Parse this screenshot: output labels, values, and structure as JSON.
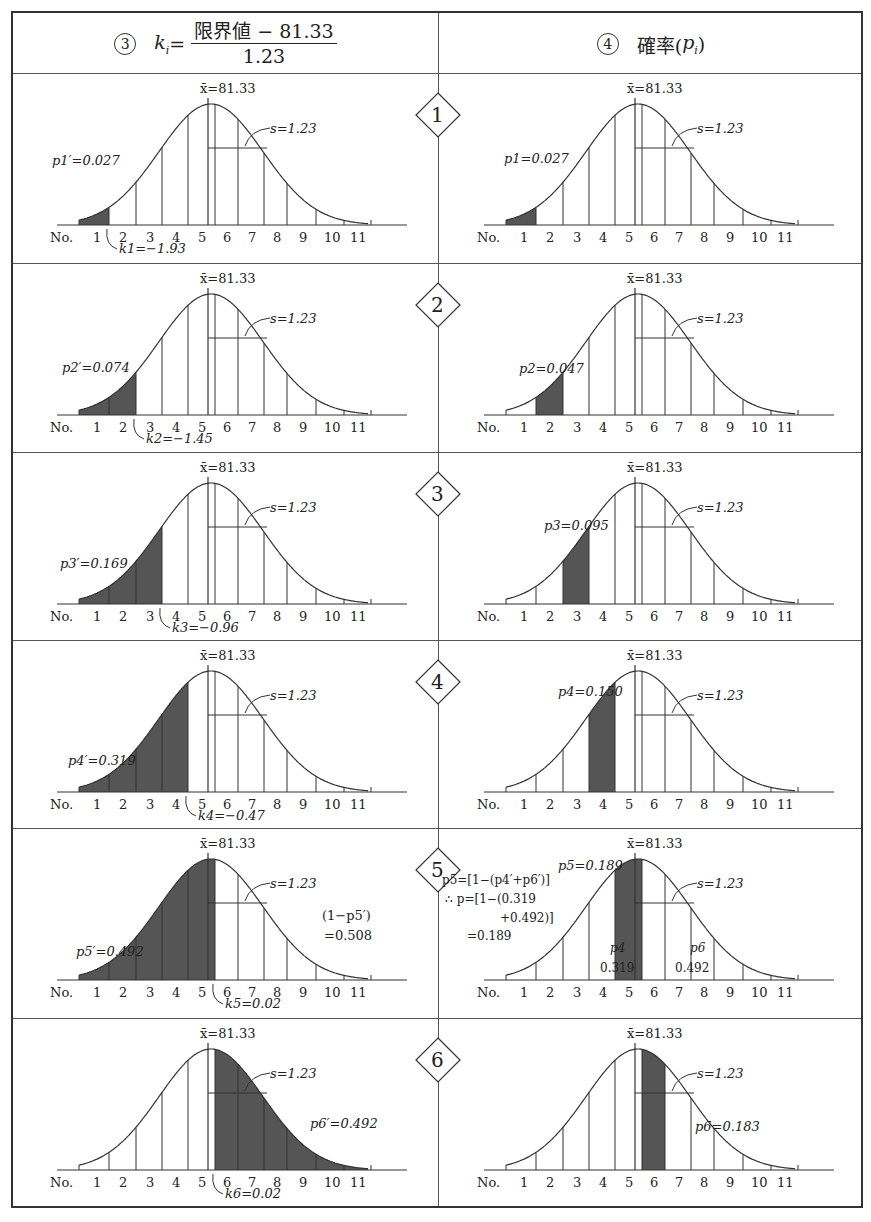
{
  "header": {
    "left": {
      "circle": "3",
      "lhs": "k",
      "lhs_sub": "i",
      "eq": "=",
      "numerator": "限界値 − 81.33",
      "denominator": "1.23"
    },
    "right": {
      "circle": "4",
      "label": "確率(",
      "p": "p",
      "p_sub": "i",
      "close": ")"
    }
  },
  "common": {
    "mean_label": "x̄=81.33",
    "sd_label": "s=1.23",
    "axis_prefix": "No.",
    "ticks": [
      "1",
      "2",
      "3",
      "4",
      "5",
      "6",
      "7",
      "8",
      "9",
      "10",
      "11"
    ]
  },
  "chart_data": [
    {
      "type": "area",
      "title": "Row 1 left",
      "step": "1",
      "k_label": "k1=−1.93",
      "k": -1.93,
      "shade": "cumulative-left",
      "area_label": "p1′=0.027",
      "area": 0.027
    },
    {
      "type": "area",
      "title": "Row 1 right",
      "step": "1",
      "shade_class": 1,
      "area_label": "p1=0.027",
      "area": 0.027
    },
    {
      "type": "area",
      "title": "Row 2 left",
      "step": "2",
      "k_label": "k2=−1.45",
      "k": -1.45,
      "shade": "cumulative-left",
      "area_label": "p2′=0.074",
      "area": 0.074
    },
    {
      "type": "area",
      "title": "Row 2 right",
      "step": "2",
      "shade_class": 2,
      "area_label": "p2=0.047",
      "area": 0.047
    },
    {
      "type": "area",
      "title": "Row 3 left",
      "step": "3",
      "k_label": "k3=−0.96",
      "k": -0.96,
      "shade": "cumulative-left",
      "area_label": "p3′=0.169",
      "area": 0.169
    },
    {
      "type": "area",
      "title": "Row 3 right",
      "step": "3",
      "shade_class": 3,
      "area_label": "p3=0.095",
      "area": 0.095
    },
    {
      "type": "area",
      "title": "Row 4 left",
      "step": "4",
      "k_label": "k4=−0.47",
      "k": -0.47,
      "shade": "cumulative-left",
      "area_label": "p4′=0.319",
      "area": 0.319
    },
    {
      "type": "area",
      "title": "Row 4 right",
      "step": "4",
      "shade_class": 4,
      "area_label": "p4=0.150",
      "area": 0.15
    },
    {
      "type": "area",
      "title": "Row 5 left",
      "step": "5",
      "k_label": "k5=0.02",
      "k": 0.02,
      "shade": "cumulative-left",
      "area_label": "p5′=0.492",
      "area": 0.492,
      "complement_label": [
        "(1−p5′)",
        "=0.508"
      ]
    },
    {
      "type": "area",
      "title": "Row 5 right",
      "step": "5",
      "shade_class": 5,
      "area_label": "p5=0.189",
      "area": 0.189,
      "formula": [
        "p5=[1−(p4′+p6′)]",
        "∴ p=[1−(0.319",
        "+0.492)]",
        "=0.189"
      ],
      "p4_label": [
        "p4",
        "0.319"
      ],
      "p6_label": [
        "p6",
        "0.492"
      ]
    },
    {
      "type": "area",
      "title": "Row 6 left",
      "step": "6",
      "k_label": "k6=0.02",
      "k": 0.02,
      "shade": "cumulative-right",
      "area_label": "p6′=0.492",
      "area": 0.492
    },
    {
      "type": "area",
      "title": "Row 6 right",
      "step": "6",
      "shade_class": 6,
      "area_label": "p6=0.183",
      "area": 0.183
    }
  ]
}
